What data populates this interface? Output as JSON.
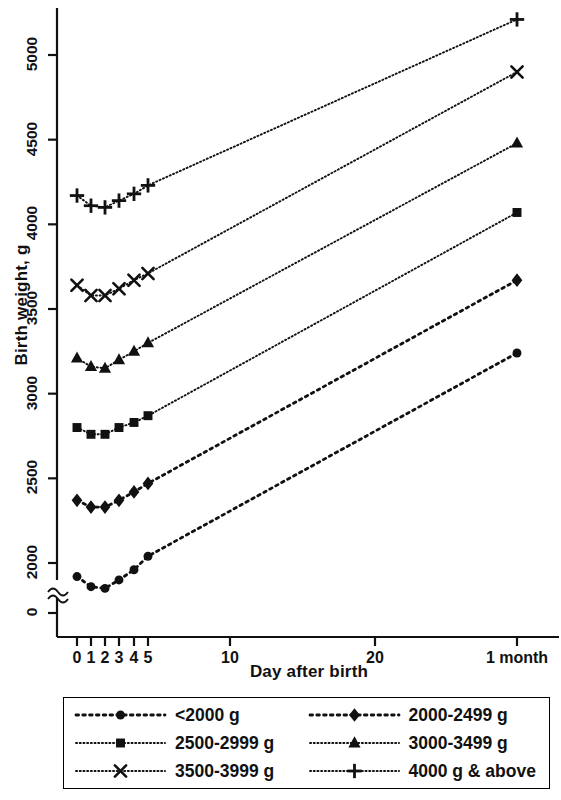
{
  "chart_data": {
    "type": "line",
    "title": "",
    "xlabel": "Day after birth",
    "ylabel": "Birth weight, g",
    "x": [
      0,
      1,
      2,
      3,
      4,
      5,
      30
    ],
    "x_tick_values": [
      0,
      1,
      2,
      3,
      4,
      5,
      10,
      20,
      30
    ],
    "x_tick_labels": [
      "0",
      "1",
      "2",
      "3",
      "4",
      "5",
      "10",
      "20",
      "1 month"
    ],
    "y_tick_values": [
      0,
      2000,
      2500,
      3000,
      3500,
      4000,
      4500,
      5000
    ],
    "y_tick_labels": [
      "0",
      "2000",
      "2500",
      "3000",
      "3500",
      "4000",
      "4500",
      "5000"
    ],
    "ylim": [
      2000,
      5200
    ],
    "y_axis_break": true,
    "y_axis_break_symbol": "≈",
    "grid": false,
    "legend_position": "below",
    "series": [
      {
        "name": "<2000 g",
        "marker": "circle",
        "line_style": "coarse-dotted",
        "values": [
          1920,
          1860,
          1850,
          1900,
          1960,
          2040,
          3240
        ]
      },
      {
        "name": "2000-2499 g",
        "marker": "diamond",
        "line_style": "coarse-dotted",
        "values": [
          2370,
          2330,
          2330,
          2370,
          2420,
          2470,
          3670
        ]
      },
      {
        "name": "2500-2999 g",
        "marker": "square",
        "line_style": "fine-dotted",
        "values": [
          2800,
          2760,
          2760,
          2800,
          2830,
          2870,
          4070
        ]
      },
      {
        "name": "3000-3499 g",
        "marker": "triangle",
        "line_style": "fine-dotted",
        "values": [
          3210,
          3160,
          3150,
          3200,
          3250,
          3300,
          4480
        ]
      },
      {
        "name": "3500-3999 g",
        "marker": "x",
        "line_style": "fine-dotted",
        "values": [
          3640,
          3580,
          3580,
          3620,
          3670,
          3710,
          4900
        ]
      },
      {
        "name": "4000 g & above",
        "marker": "plus",
        "line_style": "fine-dotted",
        "values": [
          4170,
          4110,
          4100,
          4140,
          4180,
          4230,
          5210
        ]
      }
    ]
  },
  "legend": {
    "items": [
      {
        "label": "<2000 g",
        "marker": "circle",
        "line_style": "coarse-dotted"
      },
      {
        "label": "2000-2499 g",
        "marker": "diamond",
        "line_style": "coarse-dotted"
      },
      {
        "label": "2500-2999 g",
        "marker": "square",
        "line_style": "fine-dotted"
      },
      {
        "label": "3000-3499 g",
        "marker": "triangle",
        "line_style": "fine-dotted"
      },
      {
        "label": "3500-3999 g",
        "marker": "x",
        "line_style": "fine-dotted"
      },
      {
        "label": "4000 g & above",
        "marker": "plus",
        "line_style": "fine-dotted"
      }
    ]
  },
  "colors": {
    "ink": "#111111",
    "axis": "#1a1a1a",
    "background": "#ffffff"
  }
}
